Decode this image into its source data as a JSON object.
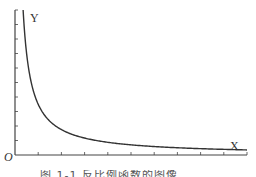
{
  "chart_data": {
    "type": "line",
    "title": "",
    "xlabel": "X",
    "ylabel": "Y",
    "origin_label": "O",
    "x_ticks_count": 10,
    "y_ticks_count": 10,
    "x_tick_labels": [],
    "y_tick_labels": [],
    "grid": false,
    "legend": null,
    "series": [
      {
        "name": "y = k/x",
        "x": [
          0.35,
          0.5,
          0.75,
          1,
          1.5,
          2,
          3,
          4,
          5,
          6,
          7,
          8,
          9,
          10
        ],
        "values": [
          10,
          7.0,
          4.7,
          3.5,
          2.35,
          1.75,
          1.17,
          0.88,
          0.7,
          0.58,
          0.5,
          0.44,
          0.39,
          0.35
        ]
      }
    ],
    "xlim": [
      0,
      10
    ],
    "ylim": [
      0,
      10
    ]
  },
  "labels": {
    "y_axis": "Y",
    "x_axis": "X",
    "origin": "O"
  },
  "caption": "图 1-1  反比例函数的图像",
  "colors": {
    "axis": "#444444",
    "curve": "#333333",
    "background": "#ffffff"
  }
}
